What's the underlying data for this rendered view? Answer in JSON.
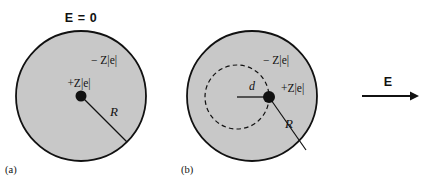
{
  "figure": {
    "width": 428,
    "height": 182,
    "background": "#ffffff",
    "sphere_fill": "#c8c8c8",
    "outline_color": "#111111",
    "charge_dot_color": "#111111",
    "text_color": "#111111"
  },
  "panel_a": {
    "tag": "(a)",
    "field_label": "E = 0",
    "negative_charge_label": "− Z|e|",
    "positive_charge_label": "+Z|e|",
    "radius_label": "R",
    "circle": {
      "cx": 81,
      "cy": 96,
      "r": 65
    },
    "center_dot": {
      "cx": 81,
      "cy": 96,
      "r": 5.5
    },
    "radius_line": {
      "x1": 81,
      "y1": 96,
      "x2": 127,
      "y2": 142
    }
  },
  "panel_b": {
    "tag": "(b)",
    "negative_charge_label": "− Z|e|",
    "positive_charge_label": "+Z|e|",
    "radius_label": "R",
    "displacement_label": "d",
    "circle": {
      "cx": 252,
      "cy": 96,
      "r": 65
    },
    "dashed_circle": {
      "cx": 237,
      "cy": 97,
      "r": 32
    },
    "charge_dot": {
      "cx": 269,
      "cy": 97,
      "r": 6
    },
    "displacement_line": {
      "x1": 237,
      "y1": 97,
      "x2": 269,
      "y2": 97
    },
    "radius_line": {
      "x1": 269,
      "y1": 97,
      "x2": 306,
      "y2": 150
    }
  },
  "field_arrow": {
    "label": "E",
    "line": {
      "x1": 362,
      "y1": 96,
      "x2": 414,
      "y2": 96
    },
    "direction": "right"
  }
}
